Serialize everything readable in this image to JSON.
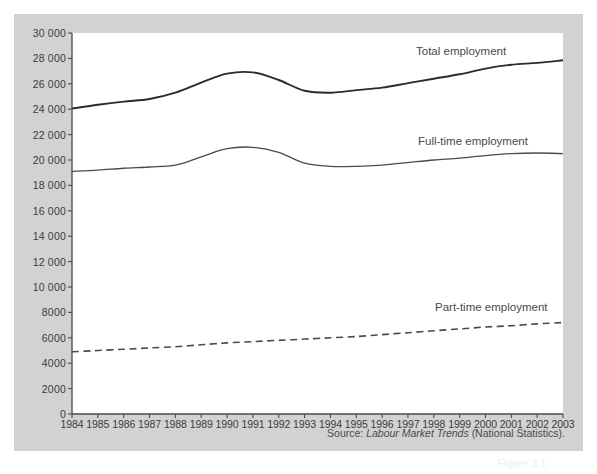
{
  "figure": {
    "background_color": "#d2d2d2",
    "plot_background_color": "#ffffff",
    "axis_color": "#4a4a4a",
    "source_prefix": "Source:",
    "source_title": "Labour Market Trends",
    "source_suffix": "(National Statistics).",
    "caption_partial": "Figure 3.1"
  },
  "chart_data": {
    "type": "line",
    "title": "",
    "xlabel": "",
    "ylabel": "",
    "xlim": [
      1984,
      2003
    ],
    "ylim": [
      0,
      30000
    ],
    "grid": false,
    "legend_position": "inline-right-of-each-series",
    "categories": [
      1984,
      1985,
      1986,
      1987,
      1988,
      1989,
      1990,
      1991,
      1992,
      1993,
      1994,
      1995,
      1996,
      1997,
      1998,
      1999,
      2000,
      2001,
      2002,
      2003
    ],
    "x": [
      "1984",
      "1985",
      "1986",
      "1987",
      "1988",
      "1989",
      "1990",
      "1991",
      "1992",
      "1993",
      "1994",
      "1995",
      "1996",
      "1997",
      "1998",
      "1999",
      "2000",
      "2001",
      "2002",
      "2003"
    ],
    "ytick_labels": [
      "0",
      "2000",
      "4000",
      "6000",
      "8000",
      "10 000",
      "12 000",
      "14 000",
      "16 000",
      "18 000",
      "20 000",
      "22 000",
      "24 000",
      "26 000",
      "28 000",
      "30 000"
    ],
    "ytick_values": [
      0,
      2000,
      4000,
      6000,
      8000,
      10000,
      12000,
      14000,
      16000,
      18000,
      20000,
      22000,
      24000,
      26000,
      28000,
      30000
    ],
    "series": [
      {
        "name": "Total employment",
        "style": "solid",
        "color": "#2b2b2b",
        "width": 1.9,
        "values": [
          24050,
          24350,
          24600,
          24800,
          25300,
          26100,
          26800,
          26900,
          26300,
          25450,
          25300,
          25500,
          25700,
          26050,
          26400,
          26750,
          27200,
          27500,
          27650,
          27850
        ]
      },
      {
        "name": "Full-time employment",
        "style": "solid",
        "color": "#4a4a4a",
        "width": 1.3,
        "values": [
          19100,
          19200,
          19350,
          19450,
          19600,
          20250,
          20900,
          21000,
          20600,
          19750,
          19500,
          19500,
          19600,
          19800,
          20000,
          20150,
          20350,
          20500,
          20550,
          20500
        ]
      },
      {
        "name": "Part-time employment",
        "style": "dashed",
        "color": "#4a4a4a",
        "width": 1.6,
        "values": [
          4900,
          5000,
          5100,
          5200,
          5300,
          5450,
          5600,
          5700,
          5800,
          5900,
          6000,
          6100,
          6250,
          6400,
          6550,
          6700,
          6850,
          6950,
          7100,
          7200
        ]
      }
    ]
  },
  "labels": {
    "total": "Total employment",
    "fulltime": "Full-time employment",
    "parttime": "Part-time employment"
  }
}
